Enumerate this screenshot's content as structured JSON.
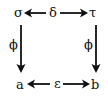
{
  "diagram": {
    "type": "commutative-square",
    "nodes": {
      "top_left": "σ",
      "top_right": "τ",
      "bottom_left": "a",
      "bottom_right": "b"
    },
    "edges": {
      "top": {
        "label": "δ",
        "from_center": true,
        "targets": [
          "σ",
          "τ"
        ]
      },
      "bottom": {
        "label": "ε",
        "from_center": true,
        "targets": [
          "a",
          "b"
        ]
      },
      "left": {
        "label": "ϕ",
        "from": "σ",
        "to": "a"
      },
      "right": {
        "label": "ϕ",
        "from": "τ",
        "to": "b"
      }
    },
    "colors": {
      "ink": "#111111",
      "background": "#ffffff"
    }
  }
}
